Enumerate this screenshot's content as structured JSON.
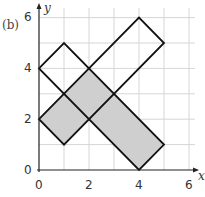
{
  "figure": {
    "part_label": "(b)",
    "x_axis_label": "x",
    "y_axis_label": "y",
    "x_ticks": [
      "0",
      "2",
      "4",
      "6"
    ],
    "y_ticks": [
      "0",
      "2",
      "4",
      "6"
    ],
    "grid_range": {
      "x": [
        0,
        6
      ],
      "y": [
        0,
        6
      ]
    },
    "colors": {
      "shaded": "#cfcfcf",
      "outline": "#111111",
      "grid": "#d6d6d6"
    },
    "shapes": [
      {
        "name": "rectangle-a",
        "vertices": [
          [
            0,
            2
          ],
          [
            4,
            6
          ],
          [
            5,
            5
          ],
          [
            1,
            1
          ]
        ],
        "fill": "none"
      },
      {
        "name": "rectangle-b",
        "vertices": [
          [
            0,
            4
          ],
          [
            1,
            5
          ],
          [
            5,
            1
          ],
          [
            4,
            0
          ]
        ],
        "fill": "none"
      },
      {
        "name": "shaded-region",
        "vertices": [
          [
            0,
            2
          ],
          [
            1,
            3
          ],
          [
            2,
            4
          ],
          [
            3,
            3
          ],
          [
            5,
            1
          ],
          [
            4,
            0
          ],
          [
            2,
            2
          ],
          [
            1,
            1
          ]
        ],
        "fill": "#cfcfcf"
      }
    ]
  }
}
